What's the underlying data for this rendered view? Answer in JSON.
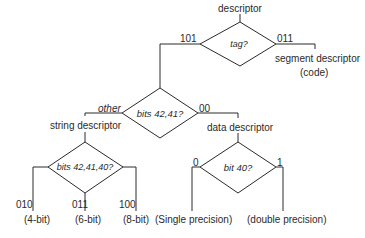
{
  "diagram": {
    "root": "descriptor",
    "nodes": {
      "tag": {
        "question": "tag?",
        "branch_left": "101",
        "branch_right": "011"
      },
      "segment": {
        "label": "segment descriptor",
        "sublabel": "(code)"
      },
      "bits4241": {
        "question": "bits 42,41?",
        "branch_left": "other",
        "branch_right": "00"
      },
      "string": {
        "label": "string descriptor"
      },
      "data": {
        "label": "data descriptor"
      },
      "bits424140": {
        "question": "bits 42,41,40?",
        "branch_left": "010",
        "branch_mid": "011",
        "branch_right": "100"
      },
      "bit40": {
        "question": "bit 40?",
        "branch_left": "0",
        "branch_right": "1"
      }
    },
    "leaves": {
      "four_bit": "(4-bit)",
      "six_bit": "(6-bit)",
      "eight_bit": "(8-bit)",
      "single": "(Single precision)",
      "double": "(double precision)"
    },
    "colors": {
      "line": "#2a2a2a",
      "background": "#ffffff"
    }
  }
}
